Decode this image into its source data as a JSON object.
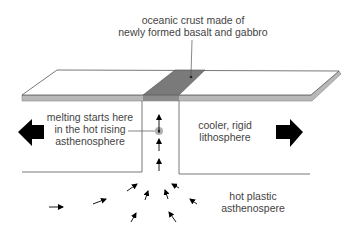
{
  "diagram": {
    "labels": {
      "oceanic_crust": {
        "lines": [
          "oceanic crust made of",
          "newly formed basalt and gabbro"
        ],
        "x": 193,
        "y": 14
      },
      "melting": {
        "lines": [
          "melting starts here",
          "in the hot rising",
          "asthenosphere"
        ],
        "x": 90,
        "y": 111
      },
      "lithosphere": {
        "lines": [
          "cooler, rigid",
          "lithosphere"
        ],
        "x": 225,
        "y": 119
      },
      "asthenosphere": {
        "lines": [
          "hot plastic",
          "asthenospere"
        ],
        "x": 253,
        "y": 190
      }
    },
    "colors": {
      "outline": "#555555",
      "slab_top": "#ffffff",
      "slab_edge": "#b8b8b8",
      "new_crust": "#7a7a7a",
      "arrow": "#000000",
      "melt_halo": "#b0b0b0",
      "text": "#444444"
    },
    "plate_motion_arrows": [
      {
        "direction": "left",
        "name": "left-plate-motion"
      },
      {
        "direction": "right",
        "name": "right-plate-motion"
      }
    ],
    "upwelling_arrows": [
      {
        "x1": 159,
        "y1": 133,
        "x2": 159,
        "y2": 115
      },
      {
        "x1": 159,
        "y1": 151,
        "x2": 159,
        "y2": 139
      },
      {
        "x1": 159,
        "y1": 171,
        "x2": 159,
        "y2": 159
      }
    ],
    "mantle_flow_arrows": [
      {
        "x1": 49,
        "y1": 207,
        "x2": 63,
        "y2": 207
      },
      {
        "x1": 93,
        "y1": 204,
        "x2": 106,
        "y2": 199
      },
      {
        "x1": 127,
        "y1": 191,
        "x2": 137,
        "y2": 184
      },
      {
        "x1": 145,
        "y1": 200,
        "x2": 148,
        "y2": 191
      },
      {
        "x1": 131,
        "y1": 222,
        "x2": 136,
        "y2": 213
      },
      {
        "x1": 168,
        "y1": 199,
        "x2": 165,
        "y2": 190
      },
      {
        "x1": 179,
        "y1": 188,
        "x2": 172,
        "y2": 184
      },
      {
        "x1": 197,
        "y1": 204,
        "x2": 190,
        "y2": 199
      },
      {
        "x1": 176,
        "y1": 222,
        "x2": 169,
        "y2": 212
      }
    ]
  }
}
